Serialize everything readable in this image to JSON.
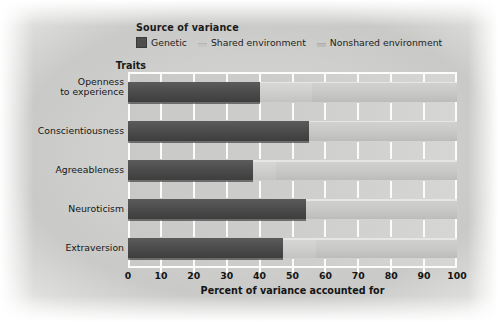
{
  "legend": {
    "title": "Source of variance",
    "entries": [
      {
        "name": "Genetic",
        "swatch": "genetic-swatch-icon",
        "color": "#4a4a4a"
      },
      {
        "name": "Shared environment",
        "swatch": "shared-swatch-icon",
        "color": "#cdcdcb"
      },
      {
        "name": "Nonshared environment",
        "swatch": "nonshared-swatch-icon",
        "color": "#c7c7c5"
      }
    ]
  },
  "axis_group_title": "Traits",
  "chart_data": {
    "type": "bar",
    "orientation": "horizontal",
    "stacked": true,
    "title": "",
    "xlabel": "Percent of variance accounted for",
    "ylabel": "Traits",
    "xlim": [
      0,
      100
    ],
    "xticks": [
      0,
      10,
      20,
      30,
      40,
      50,
      60,
      70,
      80,
      90,
      100
    ],
    "xticklabels": [
      "0",
      "10",
      "20",
      "30",
      "40",
      "50",
      "60",
      "70",
      "80",
      "90",
      "100"
    ],
    "grid": true,
    "legend_position": "top",
    "categories": [
      "Openness to experience",
      "Conscientiousness",
      "Agreeableness",
      "Neuroticism",
      "Extraversion"
    ],
    "series": [
      {
        "name": "Genetic",
        "values": [
          40,
          55,
          38,
          54,
          47
        ]
      },
      {
        "name": "Shared environment",
        "values": [
          16,
          0,
          7,
          0,
          10
        ]
      },
      {
        "name": "Nonshared environment",
        "values": [
          44,
          45,
          55,
          46,
          43
        ]
      }
    ]
  }
}
